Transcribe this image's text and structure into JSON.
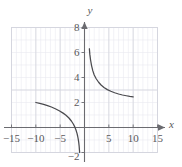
{
  "figure": {
    "name": "rational-function-graph",
    "background": "#ffffff",
    "ink_color": "#58585a",
    "grid_minor_color": "#e9eaf0",
    "grid_major_color": "#d4d5de",
    "axis_color": "#6b6b70",
    "curve_color": "#4a4a4e"
  },
  "chart_data": {
    "type": "line",
    "title": "",
    "subtitle": "",
    "xlabel": "x",
    "ylabel": "y",
    "xlim": [
      -15,
      15
    ],
    "ylim": [
      -2,
      8
    ],
    "grid": true,
    "grid_minor_step": 1,
    "grid_major_step": 5,
    "legend": null,
    "legend_position": "none",
    "xticks": [
      -15,
      -10,
      -5,
      5,
      10,
      15
    ],
    "xtick_labels": [
      "−15",
      "−10",
      "−5",
      "5",
      "10",
      "15"
    ],
    "yticks": [
      -2,
      2,
      4,
      6,
      8
    ],
    "ytick_labels": [
      "−2",
      "2",
      "4",
      "6",
      "8"
    ],
    "x_axis_arrow": true,
    "y_axis_arrow": true,
    "series": [
      {
        "name": "left-branch",
        "points": [
          [
            -10.0,
            2.0
          ],
          [
            -9.2,
            1.93
          ],
          [
            -8.4,
            1.85
          ],
          [
            -7.6,
            1.75
          ],
          [
            -6.8,
            1.64
          ],
          [
            -6.0,
            1.5
          ],
          [
            -5.2,
            1.34
          ],
          [
            -4.4,
            1.15
          ],
          [
            -3.8,
            0.98
          ],
          [
            -3.2,
            0.76
          ],
          [
            -2.7,
            0.52
          ],
          [
            -2.3,
            0.28
          ],
          [
            -2.0,
            0.05
          ],
          [
            -1.75,
            -0.2
          ],
          [
            -1.55,
            -0.45
          ],
          [
            -1.4,
            -0.7
          ],
          [
            -1.28,
            -0.95
          ],
          [
            -1.18,
            -1.22
          ],
          [
            -1.1,
            -1.5
          ],
          [
            -1.05,
            -1.75
          ],
          [
            -1.0,
            -2.0
          ]
        ]
      },
      {
        "name": "right-branch",
        "points": [
          [
            1.0,
            6.3
          ],
          [
            1.1,
            5.85
          ],
          [
            1.25,
            5.4
          ],
          [
            1.45,
            4.95
          ],
          [
            1.7,
            4.55
          ],
          [
            2.0,
            4.2
          ],
          [
            2.4,
            3.9
          ],
          [
            2.9,
            3.62
          ],
          [
            3.4,
            3.4
          ],
          [
            4.0,
            3.2
          ],
          [
            4.7,
            3.03
          ],
          [
            5.4,
            2.9
          ],
          [
            6.2,
            2.78
          ],
          [
            7.0,
            2.68
          ],
          [
            7.8,
            2.6
          ],
          [
            8.6,
            2.54
          ],
          [
            9.3,
            2.49
          ],
          [
            10.0,
            2.45
          ]
        ]
      }
    ]
  }
}
